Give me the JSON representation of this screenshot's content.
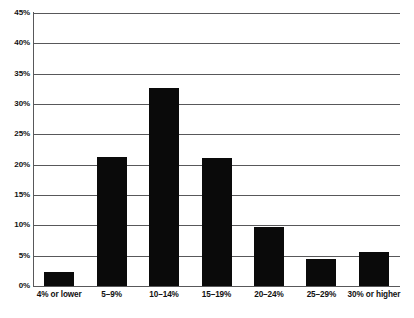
{
  "chart_data": {
    "type": "bar",
    "title": "",
    "subtitle": "",
    "xlabel": "",
    "ylabel": "",
    "categories": [
      "4% or lower",
      "5–9%",
      "10–14%",
      "15–19%",
      "20–24%",
      "25–29%",
      "30% or higher"
    ],
    "values": [
      2.3,
      21.3,
      32.6,
      21.1,
      9.7,
      4.5,
      5.6
    ],
    "ylim": [
      0,
      45
    ],
    "ytick_values": [
      0,
      5,
      10,
      15,
      20,
      25,
      30,
      35,
      40,
      45
    ],
    "ytick_labels": [
      "0%",
      "5%",
      "10%",
      "15%",
      "20%",
      "25%",
      "30%",
      "35%",
      "40%",
      "45%"
    ],
    "grid": "horizontal",
    "legend": "none",
    "bar_color": "#0a0a0a",
    "axis_color": "#58585a",
    "background_color": "#ffffff"
  },
  "axes": {
    "y": {
      "ticks": [
        {
          "label": "45%",
          "value": 45
        },
        {
          "label": "40%",
          "value": 40
        },
        {
          "label": "35%",
          "value": 35
        },
        {
          "label": "30%",
          "value": 30
        },
        {
          "label": "25%",
          "value": 25
        },
        {
          "label": "20%",
          "value": 20
        },
        {
          "label": "15%",
          "value": 15
        },
        {
          "label": "10%",
          "value": 10
        },
        {
          "label": "5%",
          "value": 5
        },
        {
          "label": "0%",
          "value": 0
        }
      ]
    },
    "x": {
      "ticks": [
        {
          "label": "4% or lower"
        },
        {
          "label": "5–9%"
        },
        {
          "label": "10–14%"
        },
        {
          "label": "15–19%"
        },
        {
          "label": "20–24%"
        },
        {
          "label": "25–29%"
        },
        {
          "label": "30% or higher"
        }
      ]
    }
  }
}
